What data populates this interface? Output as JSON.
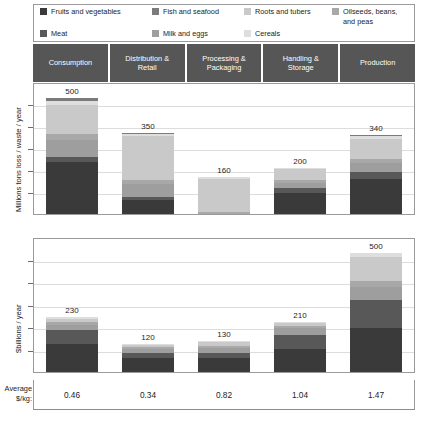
{
  "legend": {
    "items": [
      {
        "label": "Fruits and vegetables",
        "color": "#3a3a3a",
        "width_class": "w1"
      },
      {
        "label": "Fish and seafood",
        "color": "#7b7b7b",
        "width_class": "w2"
      },
      {
        "label": "Roots and tubers",
        "color": "#c9c9c9",
        "width_class": "w3"
      },
      {
        "label": "Oilseeds, beans,\nand peas",
        "color": "#a8a8a8",
        "width_class": "w4"
      },
      {
        "label": "Meat",
        "color": "#585858",
        "width_class": "w1"
      },
      {
        "label": "Milk and eggs",
        "color": "#9e9e9e",
        "width_class": "w2"
      },
      {
        "label": "Cereals",
        "color": "#dedede",
        "width_class": "w3"
      }
    ]
  },
  "columns": [
    {
      "header": "Consumption"
    },
    {
      "header": "Distribution &\nRetail"
    },
    {
      "header": "Processing &\nPackaging"
    },
    {
      "header": "Handling &\nStorage"
    },
    {
      "header": "Production"
    }
  ],
  "average_row": {
    "label": "Average\n$/kg:",
    "values": [
      "0.46",
      "0.34",
      "0.82",
      "1.04",
      "1.47"
    ]
  },
  "chart_data": [
    {
      "type": "bar",
      "stacked": true,
      "title": "",
      "ylabel": "Millions tons loss / waste / year",
      "xlabel": "",
      "ylim": [
        0,
        560
      ],
      "grid": true,
      "legend_position": "top",
      "categories": [
        "Consumption",
        "Distribution & Retail",
        "Processing & Packaging",
        "Handling & Storage",
        "Production"
      ],
      "totals": [
        500,
        350,
        160,
        200,
        340
      ],
      "total_labels": [
        "500",
        "350",
        "160",
        "200",
        "340"
      ],
      "series": [
        {
          "name": "Fruits and vegetables",
          "color": "#3a3a3a",
          "values": [
            225,
            60,
            0,
            90,
            150
          ]
        },
        {
          "name": "Meat",
          "color": "#585858",
          "values": [
            20,
            15,
            0,
            20,
            30
          ]
        },
        {
          "name": "Milk and eggs",
          "color": "#9e9e9e",
          "values": [
            75,
            55,
            0,
            25,
            40
          ]
        },
        {
          "name": "Oilseeds, beans, and peas",
          "color": "#a8a8a8",
          "values": [
            25,
            15,
            10,
            10,
            15
          ]
        },
        {
          "name": "Roots and tubers",
          "color": "#c9c9c9",
          "values": [
            125,
            190,
            140,
            50,
            90
          ]
        },
        {
          "name": "Cereals",
          "color": "#dedede",
          "values": [
            15,
            10,
            10,
            5,
            10
          ]
        },
        {
          "name": "Fish and seafood",
          "color": "#7b7b7b",
          "values": [
            15,
            5,
            0,
            0,
            5
          ]
        }
      ]
    },
    {
      "type": "bar",
      "stacked": true,
      "title": "",
      "ylabel": "$billions / year",
      "xlabel": "",
      "ylim": [
        0,
        560
      ],
      "grid": true,
      "legend_position": "top",
      "categories": [
        "Consumption",
        "Distribution & Retail",
        "Processing & Packaging",
        "Handling & Storage",
        "Production"
      ],
      "totals": [
        230,
        120,
        130,
        210,
        500
      ],
      "total_labels": [
        "230",
        "120",
        "130",
        "210",
        "500"
      ],
      "series": [
        {
          "name": "Fruits and vegetables",
          "color": "#3a3a3a",
          "values": [
            120,
            60,
            60,
            95,
            185
          ]
        },
        {
          "name": "Meat",
          "color": "#585858",
          "values": [
            55,
            20,
            20,
            60,
            120
          ]
        },
        {
          "name": "Milk and eggs",
          "color": "#9e9e9e",
          "values": [
            25,
            15,
            20,
            30,
            55
          ]
        },
        {
          "name": "Oilseeds, beans, and peas",
          "color": "#a8a8a8",
          "values": [
            10,
            10,
            10,
            10,
            25
          ]
        },
        {
          "name": "Roots and tubers",
          "color": "#c9c9c9",
          "values": [
            15,
            10,
            15,
            10,
            100
          ]
        },
        {
          "name": "Cereals",
          "color": "#dedede",
          "values": [
            5,
            5,
            5,
            5,
            15
          ]
        }
      ]
    }
  ]
}
